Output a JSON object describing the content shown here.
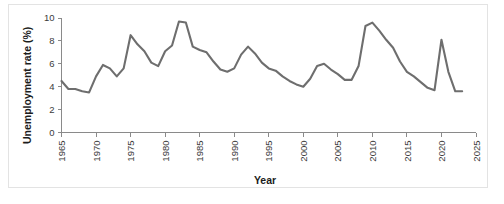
{
  "figure": {
    "background_color": "#ffffff",
    "frame_color": "#e3e3e3",
    "axis_color": "#8a8a8a"
  },
  "chart_data": {
    "type": "line",
    "title": "",
    "subtitle": "",
    "xlabel": "Year",
    "ylabel": "Unemployment rate (%)",
    "xlim": [
      1965,
      2025
    ],
    "ylim": [
      0,
      10
    ],
    "xticks": [
      1965,
      1970,
      1975,
      1980,
      1985,
      1990,
      1995,
      2000,
      2005,
      2010,
      2015,
      2020,
      2025
    ],
    "yticks": [
      0,
      2,
      4,
      6,
      8,
      10
    ],
    "xtick_labels": [
      "1965",
      "1970",
      "1975",
      "1980",
      "1985",
      "1990",
      "1995",
      "2000",
      "2005",
      "2010",
      "2015",
      "2020",
      "2025"
    ],
    "ytick_labels": [
      "0",
      "2",
      "4",
      "6",
      "8",
      "10"
    ],
    "grid": false,
    "legend": null,
    "legend_position": "none",
    "annotations": [],
    "series": [
      {
        "name": "Unemployment rate",
        "color": "#6e6e6e",
        "line_width": 2.1,
        "x": [
          1965,
          1966,
          1967,
          1968,
          1969,
          1970,
          1971,
          1972,
          1973,
          1974,
          1975,
          1976,
          1977,
          1978,
          1979,
          1980,
          1981,
          1982,
          1983,
          1984,
          1985,
          1986,
          1987,
          1988,
          1989,
          1990,
          1991,
          1992,
          1993,
          1994,
          1995,
          1996,
          1997,
          1998,
          1999,
          2000,
          2001,
          2002,
          2003,
          2004,
          2005,
          2006,
          2007,
          2008,
          2009,
          2010,
          2011,
          2012,
          2013,
          2014,
          2015,
          2016,
          2017,
          2018,
          2019,
          2020,
          2021,
          2022,
          2023
        ],
        "y": [
          4.5,
          3.8,
          3.8,
          3.6,
          3.5,
          4.9,
          5.9,
          5.6,
          4.9,
          5.6,
          8.5,
          7.7,
          7.1,
          6.1,
          5.8,
          7.1,
          7.6,
          9.7,
          9.6,
          7.5,
          7.2,
          7.0,
          6.2,
          5.5,
          5.3,
          5.6,
          6.8,
          7.5,
          6.9,
          6.1,
          5.6,
          5.4,
          4.9,
          4.5,
          4.2,
          4.0,
          4.7,
          5.8,
          6.0,
          5.5,
          5.1,
          4.6,
          4.6,
          5.8,
          9.3,
          9.6,
          8.9,
          8.1,
          7.4,
          6.2,
          5.3,
          4.9,
          4.4,
          3.9,
          3.7,
          8.1,
          5.3,
          3.6,
          3.6
        ]
      }
    ]
  }
}
